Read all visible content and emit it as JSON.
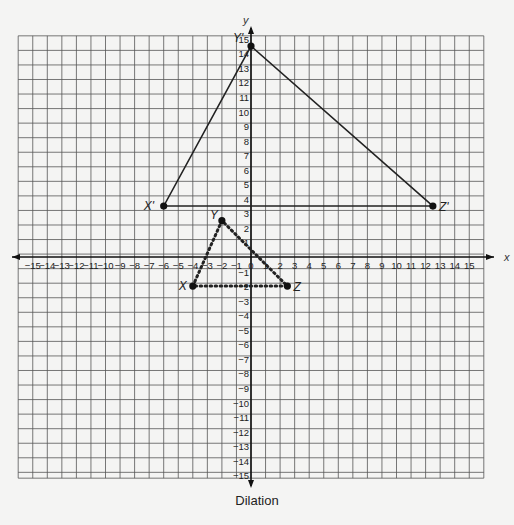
{
  "figure": {
    "caption": "Dilation",
    "x_axis_label": "x",
    "y_axis_label": "y",
    "colors": {
      "grid": "#555555",
      "axis": "#111111",
      "line": "#222222",
      "background": "#f4f4f3"
    }
  },
  "chart_data": {
    "type": "scatter",
    "title": "Dilation",
    "xlabel": "x",
    "ylabel": "y",
    "xlim": [
      -15,
      15
    ],
    "ylim": [
      -15,
      15
    ],
    "grid": true,
    "x_ticks": [
      -15,
      -14,
      -13,
      -12,
      -11,
      -10,
      -9,
      -8,
      -7,
      -6,
      -5,
      -4,
      -3,
      -2,
      -1,
      0,
      1,
      2,
      3,
      4,
      5,
      6,
      7,
      8,
      9,
      10,
      11,
      12,
      13,
      14,
      15
    ],
    "y_ticks": [
      -15,
      -14,
      -13,
      -12,
      -11,
      -10,
      -9,
      -8,
      -7,
      -6,
      -5,
      -4,
      -3,
      -2,
      -1,
      1,
      2,
      3,
      4,
      5,
      6,
      7,
      8,
      9,
      10,
      11,
      12,
      13,
      14,
      15
    ],
    "series": [
      {
        "name": "Pre-image XYZ",
        "style": "dotted",
        "points": [
          {
            "label": "X",
            "x": -4,
            "y": -2
          },
          {
            "label": "Y",
            "x": -2,
            "y": 2.5
          },
          {
            "label": "Z",
            "x": 2.5,
            "y": -2
          }
        ]
      },
      {
        "name": "Image X'Y'Z'",
        "style": "solid",
        "points": [
          {
            "label": "X'",
            "x": -6,
            "y": 3.5
          },
          {
            "label": "Y'",
            "x": 0,
            "y": 14.5
          },
          {
            "label": "Z'",
            "x": 12.5,
            "y": 3.5
          }
        ]
      }
    ]
  }
}
